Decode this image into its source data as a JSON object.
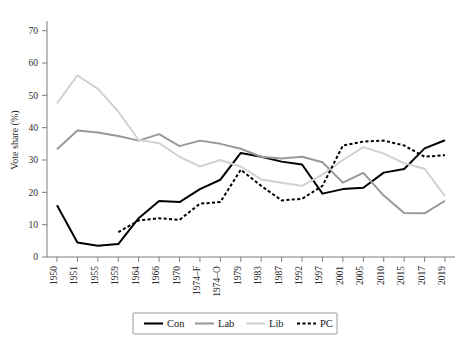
{
  "chart_data": {
    "type": "line",
    "title": "",
    "subtitle": "",
    "xlabel": "",
    "ylabel": "Vote share (%)",
    "ylim": [
      0,
      73
    ],
    "yticks": [
      0,
      10,
      20,
      30,
      40,
      50,
      60,
      70
    ],
    "ytick_labels": [
      "0",
      "10",
      "20",
      "30",
      "40",
      "50",
      "60",
      "70"
    ],
    "grid": false,
    "legend_position": "bottom",
    "categories": [
      "1950",
      "1951",
      "1955",
      "1959",
      "1964",
      "1966",
      "1970",
      "1974–F",
      "1974–O",
      "1979",
      "1983",
      "1987",
      "1992",
      "1997",
      "2001",
      "2005",
      "2010",
      "2015",
      "2017",
      "2019"
    ],
    "series": [
      {
        "name": "Con",
        "color": "#000000",
        "style": "solid",
        "width": 2.0,
        "values": [
          16.0,
          4.5,
          3.5,
          4.0,
          12.0,
          17.3,
          17.0,
          21.0,
          23.9,
          32.2,
          31.0,
          29.5,
          28.6,
          19.6,
          21.0,
          21.4,
          26.1,
          27.2,
          33.6,
          36.1
        ]
      },
      {
        "name": "Lab",
        "color": "#999999",
        "style": "solid",
        "width": 2.0,
        "values": [
          33.3,
          39.1,
          38.5,
          37.4,
          36.0,
          38.0,
          34.3,
          36.0,
          35.0,
          33.5,
          31.0,
          30.5,
          31.0,
          29.3,
          23.0,
          26.0,
          19.0,
          13.6,
          13.5,
          17.4
        ]
      },
      {
        "name": "Lib",
        "color": "#d2d2d2",
        "style": "solid",
        "width": 2.0,
        "values": [
          47.5,
          56.2,
          52.0,
          45.0,
          36.2,
          35.2,
          31.0,
          28.0,
          30.0,
          28.0,
          24.0,
          23.0,
          22.0,
          25.5,
          30.0,
          34.0,
          32.0,
          29.0,
          27.3,
          18.8
        ]
      },
      {
        "name": "PC",
        "color": "#000000",
        "style": "dotted",
        "width": 2.0,
        "values": [
          null,
          null,
          null,
          7.7,
          11.3,
          12.0,
          11.5,
          16.5,
          17.0,
          27.0,
          22.0,
          17.5,
          18.0,
          22.0,
          34.5,
          35.7,
          36.0,
          34.5,
          31.0,
          31.5
        ]
      }
    ]
  },
  "legend": {
    "entries": [
      {
        "label": "Con",
        "color": "#000000",
        "style": "solid"
      },
      {
        "label": "Lab",
        "color": "#999999",
        "style": "solid"
      },
      {
        "label": "Lib",
        "color": "#d2d2d2",
        "style": "solid"
      },
      {
        "label": "PC",
        "color": "#000000",
        "style": "dotted"
      }
    ]
  }
}
